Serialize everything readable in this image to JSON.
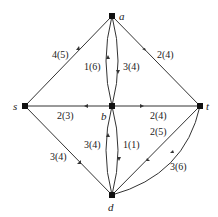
{
  "diagram": {
    "type": "network-flow",
    "nodes": [
      {
        "id": "s",
        "label": "s",
        "x": 25,
        "y": 106
      },
      {
        "id": "a",
        "label": "a",
        "x": 112,
        "y": 16
      },
      {
        "id": "b",
        "label": "b",
        "x": 112,
        "y": 106
      },
      {
        "id": "t",
        "label": "t",
        "x": 200,
        "y": 106
      },
      {
        "id": "d",
        "label": "d",
        "x": 112,
        "y": 195
      }
    ],
    "edges": [
      {
        "from": "s",
        "to": "a",
        "label": "4(5)"
      },
      {
        "from": "a",
        "to": "t",
        "label": "2(4)"
      },
      {
        "from": "b",
        "to": "a",
        "label": "1(6)"
      },
      {
        "from": "a",
        "to": "b",
        "label": "3(4)"
      },
      {
        "from": "b",
        "to": "s",
        "label": "2(3)"
      },
      {
        "from": "b",
        "to": "t",
        "label": "2(4)"
      },
      {
        "from": "s",
        "to": "d",
        "label": "3(4)"
      },
      {
        "from": "d",
        "to": "b",
        "label": "3(4)"
      },
      {
        "from": "b",
        "to": "d",
        "label": "1(1)"
      },
      {
        "from": "t",
        "to": "d",
        "label": "2(5)"
      },
      {
        "from": "d",
        "to": "t",
        "label": "3(6)"
      }
    ]
  }
}
